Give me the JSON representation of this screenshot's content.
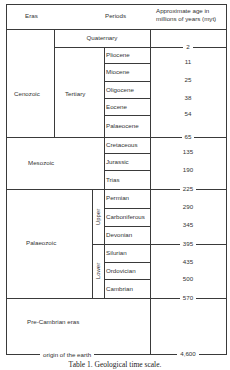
{
  "header": {
    "eras": "Eras",
    "periods": "Periods",
    "age_line1": "Approximate age in",
    "age_line2": "millions of years (myt)"
  },
  "eras": {
    "cenozoic": "Cenozoic",
    "tertiary": "Tertiary",
    "quaternary": "Quaternary",
    "mesozoic": "Mesozoic",
    "palaeozoic": "Palaeozoic",
    "upper": "Upper",
    "lower": "Lower",
    "precambrian": "Pre-Cambrian eras"
  },
  "periods": [
    {
      "name": "Pliocene",
      "age": "11"
    },
    {
      "name": "Miocene",
      "age": "25"
    },
    {
      "name": "Oligocene",
      "age": "38"
    },
    {
      "name": "Eocene",
      "age": "54"
    },
    {
      "name": "Palaeocene",
      "age": ""
    },
    {
      "name": "Cretaceous",
      "age": "135"
    },
    {
      "name": "Jurassic",
      "age": "190"
    },
    {
      "name": "Trias",
      "age": ""
    },
    {
      "name": "Permian",
      "age": "290"
    },
    {
      "name": "Carboniferous",
      "age": "345"
    },
    {
      "name": "Devonian",
      "age": ""
    },
    {
      "name": "Silurian",
      "age": "435"
    },
    {
      "name": "Ordovician",
      "age": "500"
    },
    {
      "name": "Cambrian",
      "age": ""
    }
  ],
  "boundaries": {
    "b2": "2",
    "b65": "65",
    "b225": "225",
    "b395": "395",
    "b570": "570",
    "b4600": "4,600"
  },
  "footer": {
    "origin": "origin of the earth"
  },
  "caption": "Table 1.  Geological time scale."
}
